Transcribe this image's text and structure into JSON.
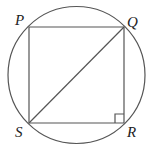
{
  "diagram": {
    "type": "geometry",
    "stroke_color": "#555555",
    "label_color": "#222222",
    "circle": {
      "cx": 76.5,
      "cy": 75,
      "r": 68.5
    },
    "vertices": {
      "P": {
        "x": 29,
        "y": 27
      },
      "Q": {
        "x": 124,
        "y": 27
      },
      "R": {
        "x": 124,
        "y": 123
      },
      "S": {
        "x": 29,
        "y": 123
      }
    },
    "labels": [
      {
        "id": "P",
        "text": "P",
        "x": 15,
        "y": 25
      },
      {
        "id": "Q",
        "text": "Q",
        "x": 127,
        "y": 27
      },
      {
        "id": "R",
        "text": "R",
        "x": 127,
        "y": 137
      },
      {
        "id": "S",
        "text": "S",
        "x": 15,
        "y": 137
      }
    ],
    "diagonal": [
      "Q",
      "S"
    ],
    "right_angle_at": "R",
    "right_angle_size": 9
  }
}
